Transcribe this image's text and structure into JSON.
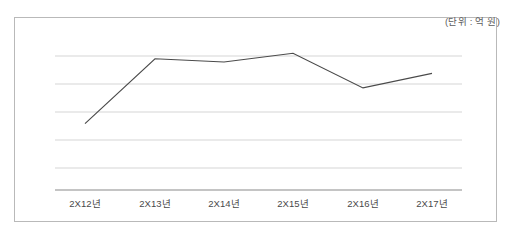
{
  "figure": {
    "unit_note": "(단위 : 억 원)",
    "border_color": "#b9b9b9",
    "background_color": "#ffffff"
  },
  "chart_data": {
    "type": "line",
    "title": "",
    "subtitle": "",
    "xlabel": "",
    "ylabel": "",
    "unit_note": "(단위 : 억 원)",
    "categories": [
      "2X12년",
      "2X13년",
      "2X14년",
      "2X15년",
      "2X16년",
      "2X17년"
    ],
    "series": [
      {
        "name": "",
        "values": [
          2.05,
          4.05,
          3.95,
          4.22,
          3.15,
          3.6
        ],
        "color": "#4a4a4a"
      }
    ],
    "ylim": [
      0,
      5
    ],
    "yticks": [
      0,
      1,
      2,
      3,
      4,
      5
    ],
    "ytick_labels": [
      "",
      "",
      "",
      "",
      "",
      ""
    ],
    "grid": true,
    "grid_axis": "y",
    "grid_color": "#d5d5d5",
    "axis_color": "#8a8a8a",
    "legend": false,
    "legend_position": "none",
    "markers": false,
    "annotations": []
  },
  "axis_labels": [
    {
      "text": "2X12년",
      "x": 85
    },
    {
      "text": "2X13년",
      "x": 155
    },
    {
      "text": "2X14년",
      "x": 224
    },
    {
      "text": "2X15년",
      "x": 293
    },
    {
      "text": "2X16년",
      "x": 363
    },
    {
      "text": "2X17년",
      "x": 432
    }
  ]
}
